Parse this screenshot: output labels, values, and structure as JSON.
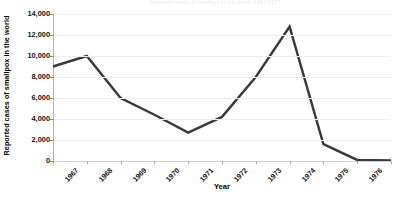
{
  "figure": {
    "title_remnant": "Reported cases of smallpox in the world, 1967-1977",
    "line_color": "#3a3a3a",
    "gridline_color": "#ededed",
    "axis_color": "#b4b4b4",
    "background_color": "#ffffff"
  },
  "chart_data": {
    "type": "line",
    "title": "",
    "xlabel": "Year",
    "ylabel": "Reported cases of smallpox in the world",
    "categories": [
      "1967",
      "1968",
      "1969",
      "1970",
      "1971",
      "1972",
      "1973",
      "1974",
      "1975",
      "1976",
      "1977"
    ],
    "values": [
      9000,
      10000,
      6000,
      4400,
      2700,
      4200,
      8000,
      12800,
      1600,
      100,
      50
    ],
    "ylim": [
      0,
      14000
    ],
    "ytick_values": [
      0,
      2000,
      4000,
      6000,
      8000,
      10000,
      12000,
      14000
    ],
    "ytick_labels": [
      "0",
      "2,000",
      "4,000",
      "6,000",
      "8,000",
      "10,000",
      "12,000",
      "14,000"
    ],
    "grid": true,
    "grid_axis": "y",
    "legend": false,
    "legend_position": "none",
    "series": [
      {
        "name": "Reported cases of smallpox in the world",
        "values": [
          9000,
          10000,
          6000,
          4400,
          2700,
          4200,
          8000,
          12800,
          1600,
          100,
          50
        ]
      }
    ],
    "annotations": []
  }
}
